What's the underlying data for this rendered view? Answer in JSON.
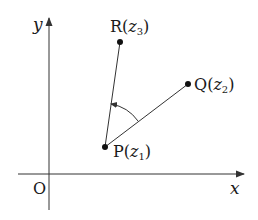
{
  "diagram": {
    "type": "complex-plane-rotation",
    "axes": {
      "x_label": "x",
      "y_label": "y",
      "origin_label": "O"
    },
    "points": [
      {
        "id": "P",
        "name": "P",
        "complex": "z",
        "sub": "1"
      },
      {
        "id": "Q",
        "name": "Q",
        "complex": "z",
        "sub": "2"
      },
      {
        "id": "R",
        "name": "R",
        "complex": "z",
        "sub": "3"
      }
    ],
    "segments": [
      "PQ",
      "PR"
    ],
    "angle": {
      "vertex": "P",
      "from": "Q",
      "to": "R",
      "direction": "counterclockwise"
    },
    "colors": {
      "stroke": "#333333",
      "text": "#1a1a1a",
      "background": "#ffffff"
    }
  }
}
